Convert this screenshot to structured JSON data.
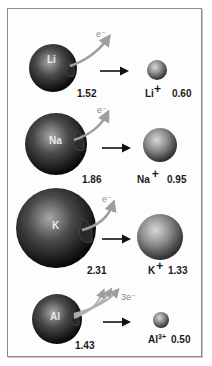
{
  "diagram": {
    "units_note": "radii values",
    "rows": [
      {
        "atom": "Li",
        "atom_radius": "1.52",
        "electron_label": "e⁻",
        "electrons": 1,
        "ion_symbol": "Li",
        "ion_charge": "+",
        "ion_radius": "0.60"
      },
      {
        "atom": "Na",
        "atom_radius": "1.86",
        "electron_label": "e⁻",
        "electrons": 1,
        "ion_symbol": "Na",
        "ion_charge": "+",
        "ion_radius": "0.95"
      },
      {
        "atom": "K",
        "atom_radius": "2.31",
        "electron_label": "e⁻",
        "electrons": 1,
        "ion_symbol": "K",
        "ion_charge": "+",
        "ion_radius": "1.33"
      },
      {
        "atom": "Al",
        "atom_radius": "1.43",
        "electron_label": "3e⁻",
        "electrons": 3,
        "ion_symbol": "Al",
        "ion_charge": "3+",
        "ion_radius": "0.50"
      }
    ],
    "colors": {
      "sphere_dark": "#111111",
      "sphere_light": "#9a9a9a",
      "ion_light": "#cfcfcf",
      "ion_dark": "#4a4a4a",
      "electron_arrow": "#9e9e9e",
      "reaction_arrow": "#111111",
      "frame": "#8a8a8a"
    }
  }
}
